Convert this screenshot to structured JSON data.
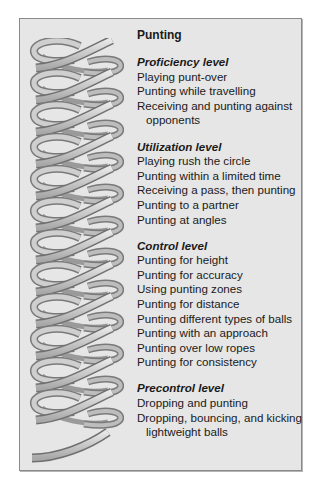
{
  "title": "Punting",
  "decoration": {
    "icon": "twisted-ribbon-spiral",
    "loops": 13
  },
  "colors": {
    "panel_bg": "#e6e6e6",
    "panel_border": "#8a8a8a",
    "text": "#1a1a1a",
    "ribbon_face": "#d2d2d2",
    "ribbon_shadow": "#8c8c8c"
  },
  "sections": [
    {
      "heading": "Proficiency level",
      "items": [
        {
          "text": "Playing punt-over"
        },
        {
          "text": "Punting while travelling"
        },
        {
          "text": "Receiving and punting against",
          "cont": "opponents"
        }
      ]
    },
    {
      "heading": "Utilization level",
      "items": [
        {
          "text": "Playing rush the circle"
        },
        {
          "text": "Punting within a limited time"
        },
        {
          "text": "Receiving a pass, then punting"
        },
        {
          "text": "Punting to a partner"
        },
        {
          "text": "Punting at angles"
        }
      ]
    },
    {
      "heading": "Control level",
      "items": [
        {
          "text": "Punting for height"
        },
        {
          "text": "Punting for accuracy"
        },
        {
          "text": "Using punting zones"
        },
        {
          "text": "Punting for distance"
        },
        {
          "text": "Punting different types of balls"
        },
        {
          "text": "Punting with an approach"
        },
        {
          "text": "Punting over low ropes"
        },
        {
          "text": "Punting for consistency"
        }
      ]
    },
    {
      "heading": "Precontrol level",
      "items": [
        {
          "text": "Dropping and punting"
        },
        {
          "text": "Dropping, bouncing, and kicking",
          "cont": "lightweight balls"
        }
      ]
    }
  ]
}
